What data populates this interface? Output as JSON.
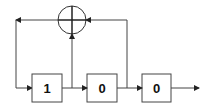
{
  "diagram": {
    "type": "linear-feedback-shift-register",
    "xor": {
      "symbol": "plus-in-circle",
      "label": "XOR adder"
    },
    "registers": [
      {
        "value": "1"
      },
      {
        "value": "0"
      },
      {
        "value": "0"
      }
    ],
    "colors": {
      "stroke": "#333333",
      "box_fill": "#ffffff",
      "text": "#111111"
    }
  }
}
